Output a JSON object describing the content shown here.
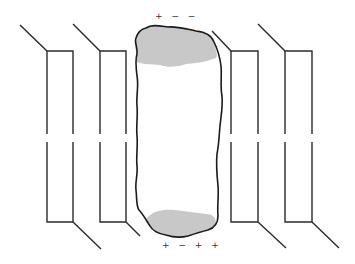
{
  "diagram": {
    "title": "",
    "colors": {
      "stroke": "#2a2a2a",
      "blob_fill": "#ffffff",
      "cap_fill": "#c8c8c8",
      "background": "#ffffff"
    },
    "labels": {
      "top_charges": "+ − −",
      "bottom_charges": "+ − + +"
    },
    "channels": [
      {
        "id": "channel-1",
        "x_left": 47,
        "x_right": 73,
        "top": 51,
        "bottom": 222,
        "top_diag_start": [
          20,
          25
        ],
        "bottom_diag_end": [
          101,
          249
        ]
      },
      {
        "id": "channel-2",
        "x_left": 100,
        "x_right": 126,
        "top": 51,
        "bottom": 222,
        "top_diag_start": [
          73,
          24
        ],
        "bottom_diag_end": [
          140,
          236
        ]
      },
      {
        "id": "channel-3",
        "x_left": 231,
        "x_right": 258,
        "top": 51,
        "bottom": 222,
        "top_diag_start": [
          210,
          30
        ],
        "bottom_diag_end": [
          286,
          248
        ]
      },
      {
        "id": "channel-4",
        "x_left": 285,
        "x_right": 312,
        "top": 51,
        "bottom": 222,
        "top_diag_start": [
          258,
          24
        ],
        "bottom_diag_end": [
          339,
          248
        ]
      }
    ],
    "break_gap": {
      "y_start": 134,
      "y_end": 142
    }
  }
}
